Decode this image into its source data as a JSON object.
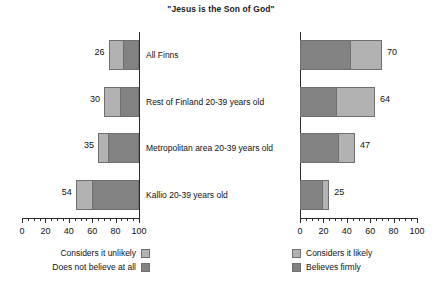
{
  "chart_data": {
    "type": "bar",
    "title": "\"Jesus is the Son of God\"",
    "orientation": "horizontal",
    "layout": "diverging-two-panel",
    "categories": [
      "All Finns",
      "Rest of Finland 20-39 years old",
      "Metropolitan area 20-39 years old",
      "Kallio 20-39 years old"
    ],
    "left_panel": {
      "axis": {
        "label": "",
        "min": 0,
        "max": 100,
        "direction": "right-to-left",
        "ticks": [
          100,
          80,
          60,
          40,
          20,
          0
        ],
        "minor_tick_step": 5,
        "grid": false
      },
      "totals": [
        26,
        30,
        35,
        54
      ],
      "series": [
        {
          "name": "Considers it unlikely",
          "color": "#b2b2b2",
          "values": [
            13,
            15,
            9,
            14
          ]
        },
        {
          "name": "Does not believe at all",
          "color": "#828282",
          "values": [
            13,
            15,
            26,
            40
          ]
        }
      ]
    },
    "right_panel": {
      "axis": {
        "label": "",
        "min": 0,
        "max": 100,
        "direction": "left-to-right",
        "ticks": [
          0,
          20,
          40,
          60,
          80,
          100
        ],
        "minor_tick_step": 5,
        "grid": false
      },
      "totals": [
        70,
        64,
        47,
        25
      ],
      "series": [
        {
          "name": "Believes firmly",
          "color": "#828282",
          "values": [
            44,
            32,
            34,
            20
          ]
        },
        {
          "name": "Considers it likely",
          "color": "#b2b2b2",
          "values": [
            26,
            32,
            13,
            5
          ]
        }
      ]
    },
    "legend_left": [
      {
        "label": "Considers it unlikely",
        "color": "#b2b2b2"
      },
      {
        "label": "Does not believe at all",
        "color": "#828282"
      }
    ],
    "legend_right": [
      {
        "label": "Considers it likely",
        "color": "#b2b2b2"
      },
      {
        "label": "Believes firmly",
        "color": "#828282"
      }
    ],
    "value_labels_left": [
      "26",
      "30",
      "35",
      "54"
    ],
    "value_labels_right": [
      "70",
      "64",
      "47",
      "25"
    ],
    "tick_labels_left": [
      "100",
      "80",
      "60",
      "40",
      "20",
      "0"
    ],
    "tick_labels_right": [
      "0",
      "20",
      "40",
      "60",
      "80",
      "100"
    ]
  }
}
